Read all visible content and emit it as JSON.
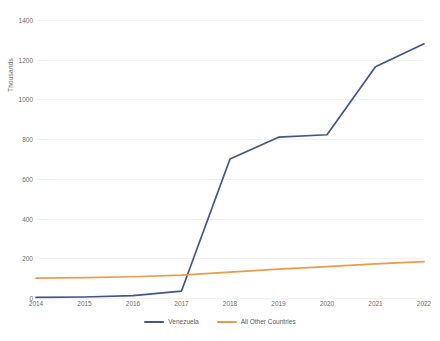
{
  "chart_data": {
    "type": "line",
    "title": "",
    "subtitle": "",
    "xlabel": "",
    "ylabel": "Thousands",
    "categories": [
      "2014",
      "2015",
      "2016",
      "2017",
      "2018",
      "2019",
      "2020",
      "2021",
      "2022"
    ],
    "x": [
      2014,
      2015,
      2016,
      2017,
      2018,
      2019,
      2020,
      2021,
      2022
    ],
    "ylim": [
      0,
      1400
    ],
    "ytick_labels": [
      "0",
      "200",
      "400",
      "600",
      "800",
      "1000",
      "1200",
      "1400"
    ],
    "yticks": [
      0,
      200,
      400,
      600,
      800,
      1000,
      1200,
      1400
    ],
    "grid": true,
    "grid_axis": "y",
    "legend_position": "bottom",
    "series": [
      {
        "name": "Venezuela",
        "color": "#46538F",
        "values": [
          3,
          5,
          12,
          35,
          700,
          810,
          822,
          1165,
          1280
        ]
      },
      {
        "name": "All Other Countries",
        "color": "#ED9B4B",
        "values": [
          100,
          103,
          107,
          115,
          130,
          145,
          158,
          172,
          183
        ]
      }
    ]
  },
  "legend": {
    "items": [
      {
        "label": "Venezuela",
        "color": "#46538F"
      },
      {
        "label": "All Other Countries",
        "color": "#ED9B4B"
      }
    ]
  },
  "axes": {
    "y_axis_title": "Thousands"
  },
  "colors": {
    "background": "#ffffff",
    "gridline": "#f2f2f2",
    "tick_text": "#6d6d6d",
    "series_venezuela": "#46538F",
    "series_all_other": "#ED9B4B"
  }
}
